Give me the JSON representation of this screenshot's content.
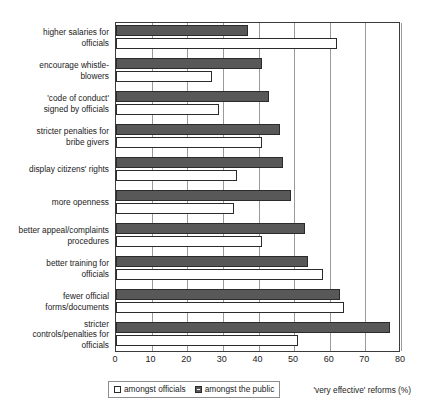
{
  "chart_data": {
    "type": "bar",
    "orientation": "horizontal",
    "title": "",
    "xlabel": "'very effective' reforms (%)",
    "ylabel": "",
    "xlim": [
      0,
      80
    ],
    "xticks": [
      "0",
      "10",
      "20",
      "30",
      "40",
      "50",
      "60",
      "70",
      "80"
    ],
    "grid": true,
    "legend_position": "bottom-left",
    "categories": [
      "higher salaries for officials",
      "encourage whistle-blowers",
      "'code of conduct' signed by officials",
      "stricter penalties for bribe givers",
      "display citizens' rights",
      "more openness",
      "better appeal/complaints procedures",
      "better training for officials",
      "fewer official forms/documents",
      "stricter controls/penalties for officials"
    ],
    "category_lines": [
      [
        "higher salaries for",
        "officials"
      ],
      [
        "encourage whistle-",
        "blowers"
      ],
      [
        "'code of conduct'",
        "signed by officials"
      ],
      [
        "stricter penalties for",
        "bribe givers"
      ],
      [
        "display citizens' rights"
      ],
      [
        "more openness"
      ],
      [
        "better appeal/complaints",
        "procedures"
      ],
      [
        "better training for",
        "officials"
      ],
      [
        "fewer official",
        "forms/documents"
      ],
      [
        "stricter",
        "controls/penalties for",
        "officials"
      ]
    ],
    "series": [
      {
        "name": "amongst the public",
        "color": "#585858",
        "values": [
          37,
          41,
          43,
          46,
          47,
          49,
          53,
          54,
          63,
          77
        ]
      },
      {
        "name": "amongst officials",
        "color": "#ffffff",
        "values": [
          62,
          27,
          29,
          41,
          34,
          33,
          41,
          58,
          64,
          51
        ]
      }
    ]
  },
  "legend": {
    "items": [
      {
        "label": "amongst officials",
        "swatch": "open-square-icon"
      },
      {
        "label": "amongst the public",
        "swatch": "filled-square-icon"
      }
    ]
  },
  "axis": {
    "caption": "'very effective' reforms (%)"
  }
}
